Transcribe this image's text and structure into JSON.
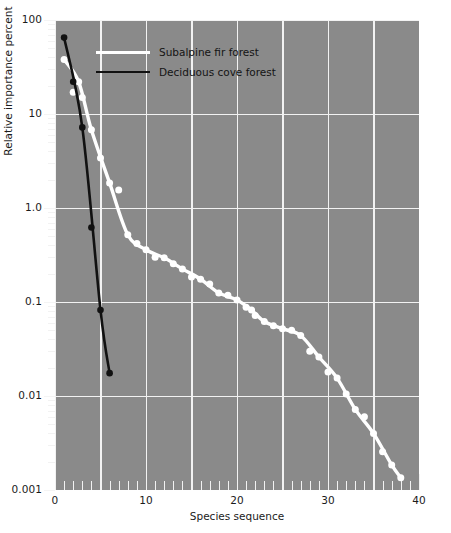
{
  "figure": {
    "background": "#ffffff",
    "plot_background": "#8a8a8a",
    "grid_color": "#f2f2f2"
  },
  "axes": {
    "y_title": "Relative importance percent",
    "x_title": "Species sequence",
    "y_tick_labels": [
      "100",
      "10",
      "1.0",
      "0.1",
      "0.01",
      "0.001"
    ],
    "x_tick_labels": [
      "0",
      "10",
      "20",
      "30",
      "40"
    ]
  },
  "legend": {
    "items": [
      {
        "label": "Subalpine fir forest",
        "color": "#ffffff"
      },
      {
        "label": "Deciduous cove forest",
        "color": "#111111"
      }
    ]
  },
  "caption_ghost": "cut off page text",
  "chart_data": {
    "type": "scatter",
    "title": "",
    "xlabel": "Species sequence",
    "ylabel": "Relative importance percent",
    "xlim": [
      0,
      40
    ],
    "ylim": [
      0.001,
      100
    ],
    "yscale": "log",
    "grid": true,
    "legend_position": "upper-left-inside",
    "x_ticks": [
      0,
      10,
      20,
      30,
      40
    ],
    "x_minor_tick_step": 1,
    "y_ticks": [
      100,
      10,
      1.0,
      0.1,
      0.01,
      0.001
    ],
    "series": [
      {
        "name": "Subalpine fir forest",
        "color": "#ffffff",
        "marker": "circle",
        "points": [
          [
            1,
            38.0
          ],
          [
            2,
            17.0
          ],
          [
            2.6,
            22.0
          ],
          [
            3,
            15.0
          ],
          [
            4,
            6.8
          ],
          [
            5,
            3.4
          ],
          [
            6,
            1.85
          ],
          [
            7,
            1.55
          ],
          [
            8,
            0.52
          ],
          [
            9,
            0.42
          ],
          [
            10,
            0.36
          ],
          [
            11,
            0.3
          ],
          [
            12,
            0.295
          ],
          [
            13,
            0.255
          ],
          [
            14,
            0.225
          ],
          [
            15,
            0.185
          ],
          [
            16,
            0.175
          ],
          [
            17,
            0.155
          ],
          [
            18,
            0.125
          ],
          [
            19,
            0.118
          ],
          [
            20,
            0.105
          ],
          [
            21,
            0.088
          ],
          [
            21.6,
            0.082
          ],
          [
            22,
            0.072
          ],
          [
            23,
            0.062
          ],
          [
            24,
            0.056
          ],
          [
            25,
            0.052
          ],
          [
            26,
            0.05
          ],
          [
            27,
            0.044
          ],
          [
            28,
            0.03
          ],
          [
            29,
            0.026
          ],
          [
            30,
            0.018
          ],
          [
            31,
            0.0155
          ],
          [
            32,
            0.0105
          ],
          [
            33,
            0.0072
          ],
          [
            34,
            0.006
          ],
          [
            35,
            0.004
          ],
          [
            36,
            0.00255
          ],
          [
            37,
            0.00185
          ],
          [
            38,
            0.00135
          ]
        ],
        "fit_line": "smooth"
      },
      {
        "name": "Deciduous cove forest",
        "color": "#111111",
        "marker": "circle",
        "points": [
          [
            1,
            65.0
          ],
          [
            2,
            22.0
          ],
          [
            3,
            7.2
          ],
          [
            4,
            0.62
          ],
          [
            5,
            0.082
          ],
          [
            6,
            0.0175
          ]
        ],
        "fit_line": "straight"
      }
    ]
  }
}
